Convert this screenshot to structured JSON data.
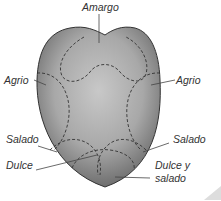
{
  "diagram": {
    "labels": {
      "amargo": "Amargo",
      "agrio_left": "Agrio",
      "agrio_right": "Agrio",
      "salado_left": "Salado",
      "salado_right": "Salado",
      "dulce": "Dulce",
      "dulce_y_salado_line1": "Dulce y",
      "dulce_y_salado_line2": "salado"
    },
    "colors": {
      "tongue_light": "#c4c4c4",
      "tongue_dark": "#7a7a7a",
      "outline": "#333333",
      "dashed": "#333333",
      "text": "#333333"
    }
  }
}
